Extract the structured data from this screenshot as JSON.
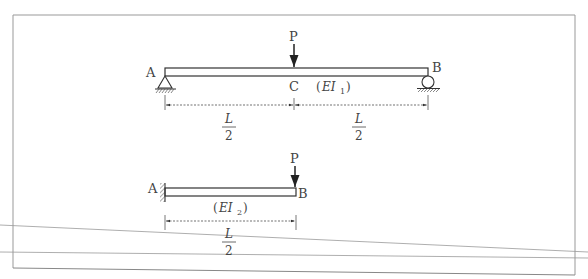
{
  "diagram": {
    "beam1": {
      "left_label": "A",
      "right_label": "B",
      "mid_label": "C",
      "load_label": "P",
      "stiffness": {
        "open": "(",
        "base": "EI",
        "sub": "1",
        "close": ")"
      },
      "dimensions": [
        {
          "num": "L",
          "den": "2"
        },
        {
          "num": "L",
          "den": "2"
        }
      ],
      "left_support": "pin",
      "right_support": "roller"
    },
    "beam2": {
      "left_label": "A",
      "right_label": "B",
      "load_label": "P",
      "stiffness": {
        "open": "(",
        "base": "EI",
        "sub": "2",
        "close": ")"
      },
      "dimension": {
        "num": "L",
        "den": "2"
      },
      "left_support": "fixed"
    }
  }
}
